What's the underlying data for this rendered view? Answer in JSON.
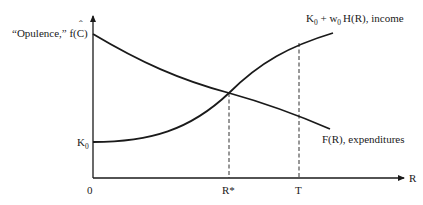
{
  "diagram": {
    "y_axis_label": "“Opulence,” f(Ĉ)",
    "y_axis_label_main": "“Opulence,” f(",
    "y_axis_label_var": "C",
    "y_axis_label_hat": "ˆ",
    "y_axis_label_close": ")",
    "x_axis_label": "R",
    "origin_label": "0",
    "k0_label": "K",
    "k0_sub": "0",
    "income_curve": {
      "label_k": "K",
      "label_k_sub": "0",
      "label_plus_w": " + w",
      "label_w_sub": "0",
      "label_rest": "H(R), income",
      "full_label": "K0 + w0 H(R), income"
    },
    "expenditure_curve": {
      "label": "F(R), expenditures"
    },
    "markers": [
      {
        "label": "R*",
        "x": 229
      },
      {
        "label": "T",
        "x": 299
      }
    ],
    "colors": {
      "line": "#1a1a1a",
      "background": "#ffffff"
    }
  }
}
